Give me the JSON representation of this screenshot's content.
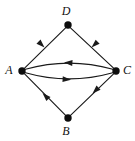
{
  "figure": {
    "name": "directed-graph-diagram",
    "background_color": "#ffffff",
    "stroke_color": "#1a1a1a",
    "node_color": "#0d0d0d",
    "width": 135,
    "height": 141
  },
  "nodes": [
    {
      "id": "D",
      "label": "D",
      "x": 68,
      "y": 25,
      "label_x": 66,
      "label_y": 12,
      "radius": 3.6
    },
    {
      "id": "A",
      "label": "A",
      "x": 22,
      "y": 71,
      "label_x": 8,
      "label_y": 71,
      "radius": 3.6
    },
    {
      "id": "C",
      "label": "C",
      "x": 116,
      "y": 71,
      "label_x": 127,
      "label_y": 71,
      "radius": 3.6
    },
    {
      "id": "B",
      "label": "B",
      "x": 68,
      "y": 118,
      "label_x": 66,
      "label_y": 132,
      "radius": 3.6
    }
  ],
  "edges": [
    {
      "id": "D-A",
      "from": "D",
      "to": "A",
      "shape": "straight",
      "arrow_at": {
        "x": 44.5,
        "y": 47.5
      },
      "arrow_angle": 225
    },
    {
      "id": "C-D",
      "from": "C",
      "to": "D",
      "shape": "straight",
      "arrow_at": {
        "x": 91.5,
        "y": 47.5
      },
      "arrow_angle": 315
    },
    {
      "id": "A-C-upper",
      "from": "A",
      "to": "C",
      "shape": "curve-up",
      "arrow_at": {
        "x": 62,
        "y": 63.5
      },
      "arrow_angle": 3
    },
    {
      "id": "C-A-lower",
      "from": "C",
      "to": "A",
      "shape": "curve-down",
      "arrow_at": {
        "x": 73,
        "y": 78.5
      },
      "arrow_angle": 183
    },
    {
      "id": "A-B",
      "from": "A",
      "to": "B",
      "shape": "straight",
      "arrow_at": {
        "x": 42.5,
        "y": 93
      },
      "arrow_angle": 46
    },
    {
      "id": "B-C",
      "from": "B",
      "to": "C",
      "shape": "straight",
      "arrow_at": {
        "x": 92.5,
        "y": 93.5
      },
      "arrow_angle": 314
    }
  ],
  "graph_data": {
    "type": "diagram",
    "directed": true,
    "node_ids": [
      "A",
      "B",
      "C",
      "D"
    ],
    "edge_list": [
      [
        "D",
        "A"
      ],
      [
        "C",
        "D"
      ],
      [
        "A",
        "C"
      ],
      [
        "C",
        "A"
      ],
      [
        "A",
        "B"
      ],
      [
        "B",
        "C"
      ]
    ]
  }
}
